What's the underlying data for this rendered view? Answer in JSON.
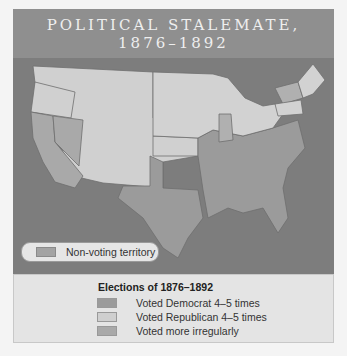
{
  "title": {
    "line1": "POLITICAL STALEMATE,",
    "line2": "1876–1892"
  },
  "map": {
    "non_voting_label": "Non-voting territory",
    "colors": {
      "water": "#7d7d7d",
      "democrat": "#9b9b9b",
      "republican": "#d2d2d2",
      "irregular": "#b0b0b0",
      "non_voting": "#bdbdbd",
      "border": "#6e6e6e"
    }
  },
  "legend": {
    "title": "Elections of 1876–1892",
    "items": [
      {
        "label": "Voted Democrat 4–5 times",
        "color": "#9b9b9b"
      },
      {
        "label": "Voted Republican 4–5 times",
        "color": "#cfcfcf"
      },
      {
        "label": "Voted more irregularly",
        "color": "#a9a9a9"
      }
    ]
  }
}
